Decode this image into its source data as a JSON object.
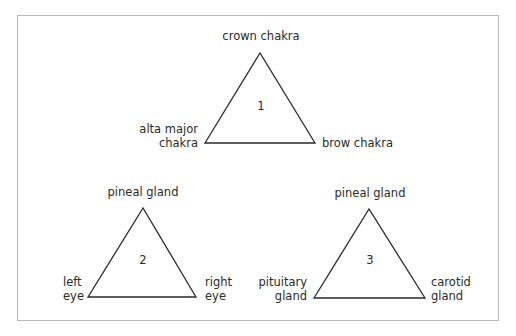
{
  "diagram": {
    "triangles": [
      {
        "number": "1",
        "top_label": "crown chakra",
        "left_label": [
          "alta major",
          "chakra"
        ],
        "right_label": [
          "brow chakra"
        ]
      },
      {
        "number": "2",
        "top_label": "pineal gland",
        "left_label": [
          "left",
          "eye"
        ],
        "right_label": [
          "right",
          "eye"
        ]
      },
      {
        "number": "3",
        "top_label": "pineal gland",
        "left_label": [
          "pituitary",
          "gland"
        ],
        "right_label": [
          "carotid",
          "gland"
        ]
      }
    ]
  }
}
